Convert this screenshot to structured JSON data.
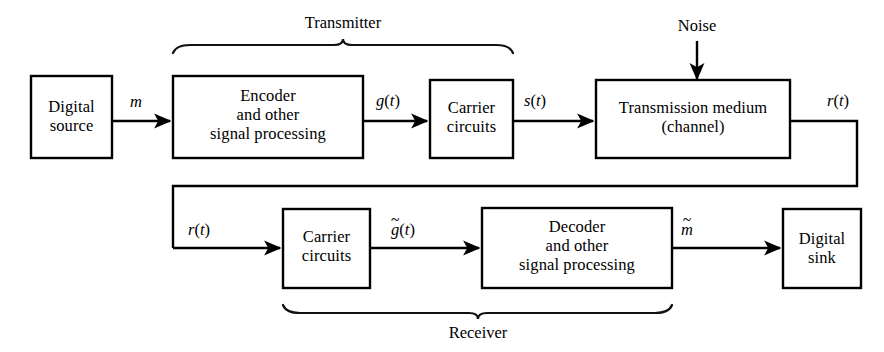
{
  "figure": {
    "type": "block-diagram",
    "background_color": "#ffffff",
    "line_color": "#000000"
  },
  "blocks": {
    "digital_source": {
      "line1": "Digital",
      "line2": "source"
    },
    "encoder": {
      "line1": "Encoder",
      "line2": "and other",
      "line3": "signal processing"
    },
    "carrier_tx": {
      "line1": "Carrier",
      "line2": "circuits"
    },
    "channel": {
      "line1": "Transmission medium",
      "line2": "(channel)"
    },
    "carrier_rx": {
      "line1": "Carrier",
      "line2": "circuits"
    },
    "decoder": {
      "line1": "Decoder",
      "line2": "and other",
      "line3": "signal processing"
    },
    "digital_sink": {
      "line1": "Digital",
      "line2": "sink"
    }
  },
  "groups": {
    "transmitter": "Transmitter",
    "receiver": "Receiver"
  },
  "signals": {
    "m": {
      "base": "m",
      "open": "",
      "close": "",
      "tilde": false
    },
    "g_t": {
      "base": "g",
      "open": "(",
      "arg": "t",
      "close": ")",
      "tilde": false
    },
    "s_t": {
      "base": "s",
      "open": "(",
      "arg": "t",
      "close": ")",
      "tilde": false
    },
    "r_t_top": {
      "base": "r",
      "open": "(",
      "arg": "t",
      "close": ")",
      "tilde": false
    },
    "r_t_bottom": {
      "base": "r",
      "open": "(",
      "arg": "t",
      "close": ")",
      "tilde": false
    },
    "g_tilde_t": {
      "base": "g",
      "open": "(",
      "arg": "t",
      "close": ")",
      "tilde": true,
      "tilde_mark": "~"
    },
    "m_tilde": {
      "base": "m",
      "open": "",
      "close": "",
      "tilde": true,
      "tilde_mark": "~"
    }
  },
  "annotations": {
    "noise": "Noise"
  }
}
